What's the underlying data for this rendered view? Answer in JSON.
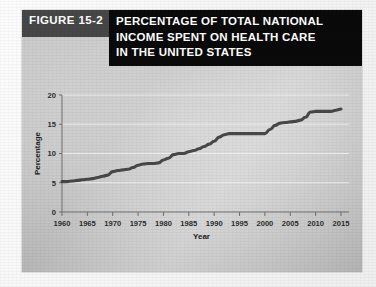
{
  "figure": {
    "tab_label": "FIGURE 15-2",
    "title_lines": [
      "PERCENTAGE OF TOTAL NATIONAL",
      "INCOME SPENT ON HEALTH CARE",
      "IN THE UNITED STATES"
    ],
    "title_full": "PERCENTAGE OF TOTAL NATIONAL INCOME SPENT ON HEALTH CARE IN THE UNITED STATES"
  },
  "colors": {
    "tab_bg": "#474747",
    "title_bg": "#0a0a0a",
    "title_text": "#ffffff",
    "panel_bg": "#c8c8c8",
    "line": "#3c3c3c",
    "gridline": "#f2f2f2",
    "axis": "#6e6e6e",
    "page_bg": "#ffffff"
  },
  "chart_data": {
    "type": "line",
    "title": "PERCENTAGE OF TOTAL NATIONAL INCOME SPENT ON HEALTH CARE IN THE UNITED STATES",
    "xlabel": "Year",
    "ylabel": "Percentage",
    "xlim": [
      1960,
      2015
    ],
    "ylim": [
      0,
      20
    ],
    "xticks": [
      1960,
      1965,
      1970,
      1975,
      1980,
      1985,
      1990,
      1995,
      2000,
      2005,
      2010,
      2015
    ],
    "xtick_labels": [
      "1960",
      "1965",
      "1970",
      "1975",
      "1980",
      "1985",
      "1990",
      "1995",
      "2000",
      "2005",
      "2010",
      "2015"
    ],
    "yticks": [
      0,
      5,
      10,
      15,
      20
    ],
    "ytick_labels": [
      "0",
      "5",
      "10",
      "15",
      "20"
    ],
    "grid": "horizontal",
    "legend": null,
    "series": [
      {
        "name": "Health care share of national income",
        "x": [
          1960,
          1961,
          1962,
          1963,
          1964,
          1965,
          1966,
          1967,
          1968,
          1969,
          1970,
          1971,
          1972,
          1973,
          1974,
          1975,
          1976,
          1977,
          1978,
          1979,
          1980,
          1981,
          1982,
          1983,
          1984,
          1985,
          1986,
          1987,
          1988,
          1989,
          1990,
          1991,
          1992,
          1993,
          1994,
          1995,
          1996,
          1997,
          1998,
          1999,
          2000,
          2001,
          2002,
          2003,
          2004,
          2005,
          2006,
          2007,
          2008,
          2009,
          2010,
          2011,
          2012,
          2013,
          2014,
          2015
        ],
        "values": [
          5.2,
          5.2,
          5.3,
          5.4,
          5.5,
          5.6,
          5.7,
          5.9,
          6.1,
          6.3,
          6.9,
          7.1,
          7.2,
          7.3,
          7.6,
          8.0,
          8.2,
          8.3,
          8.3,
          8.4,
          8.9,
          9.2,
          9.8,
          10.0,
          10.0,
          10.3,
          10.5,
          10.8,
          11.2,
          11.6,
          12.1,
          12.8,
          13.2,
          13.4,
          13.4,
          13.4,
          13.4,
          13.4,
          13.4,
          13.4,
          13.4,
          14.1,
          14.8,
          15.2,
          15.3,
          15.4,
          15.5,
          15.7,
          16.2,
          17.1,
          17.2,
          17.2,
          17.2,
          17.2,
          17.4,
          17.6
        ]
      }
    ]
  }
}
